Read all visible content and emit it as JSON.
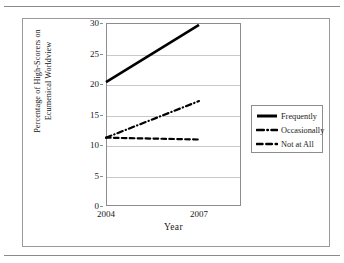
{
  "figure": {
    "has_top_rule": true,
    "has_bottom_rule": true,
    "border_color": "#9a9a9a"
  },
  "chart_data": {
    "type": "line",
    "title": "",
    "xlabel": "Year",
    "ylabel": "Percentage of High-Scorers on Ecumenical Worldview",
    "ylabel_lines": [
      "Percentage of High-Scorers on",
      "Ecumenical Worldview"
    ],
    "x": [
      2004,
      2007
    ],
    "categories": [
      "2004",
      "2007"
    ],
    "xtick_labels": [
      "2004",
      "2007"
    ],
    "ytick_labels": [
      "0",
      "5",
      "10",
      "15",
      "20",
      "25",
      "30"
    ],
    "yticks": [
      0,
      5,
      10,
      15,
      20,
      25,
      30
    ],
    "ylim": [
      0,
      30
    ],
    "xlim": [
      2004,
      2007
    ],
    "grid": true,
    "grid_axis": "y",
    "grid_color": "#c8c8c8",
    "legend_position": "right",
    "series": [
      {
        "name": "Frequently",
        "values": [
          20.3,
          29.7
        ],
        "style": "solid",
        "color": "#000000",
        "width": 2.6
      },
      {
        "name": "Occasionally",
        "values": [
          11.2,
          17.2
        ],
        "style": "dash-dot",
        "color": "#000000",
        "width": 2.2
      },
      {
        "name": "Not at All",
        "values": [
          11.2,
          10.9
        ],
        "style": "dashed",
        "color": "#000000",
        "width": 2.2
      }
    ]
  },
  "legend": {
    "entries": [
      {
        "label": "Frequently",
        "style": "solid"
      },
      {
        "label": "Occasionally",
        "style": "dash-dot"
      },
      {
        "label": "Not at All",
        "style": "dashed"
      }
    ]
  }
}
